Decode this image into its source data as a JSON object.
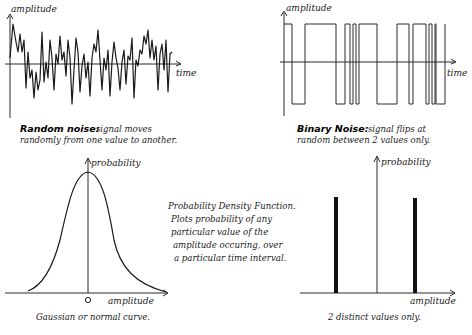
{
  "panels": {
    "random_noise": {
      "y_label": "amplitude",
      "x_label": "time",
      "caption_title": "Random noise:",
      "caption_line1": "signal moves",
      "caption_line2": "randomly from one value to another."
    },
    "binary_noise": {
      "y_label": "amplitude",
      "x_label": "time",
      "caption_title": "Binary Noise:",
      "caption_line1": "signal flips at",
      "caption_line2": "random between 2 values only."
    },
    "gaussian_pdf": {
      "y_label": "probability",
      "x_label": "amplitude",
      "origin_label": "0",
      "caption": "Gaussian or normal curve."
    },
    "pdf_note": {
      "line1": "Probability Density Function.",
      "line2": "Plots probability of any",
      "line3": "particular value of the",
      "line4": "amplitude occuring, over",
      "line5": "a particular time interval."
    },
    "binary_pdf": {
      "y_label": "probability",
      "x_label": "amplitude",
      "caption": "2 distinct values only."
    }
  },
  "colors": {
    "ink": "#1a1a1a",
    "background": "#ffffff"
  }
}
